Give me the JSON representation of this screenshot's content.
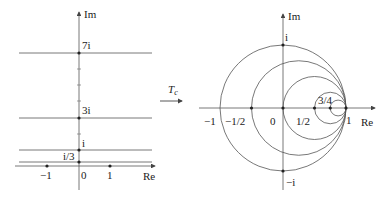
{
  "left_plane": {
    "axis_x_label": "Re",
    "axis_y_label": "Im",
    "origin_label": "0",
    "x_ticks": [
      {
        "label": "−1",
        "value": -1
      },
      {
        "label": "1",
        "value": 1
      }
    ],
    "horizontal_lines": [
      {
        "label": "7i",
        "im": 7
      },
      {
        "label": "3i",
        "im": 3
      },
      {
        "label": "i",
        "im": 1
      },
      {
        "label": "i/3",
        "im": 0.3333
      }
    ]
  },
  "transform": {
    "label": "T",
    "subscript": "c"
  },
  "right_plane": {
    "axis_x_label": "Re",
    "axis_y_label": "Im",
    "origin_label": "0",
    "top_label": "i",
    "bottom_label": "−i",
    "x_tick_labels": [
      "−1",
      "−1/2",
      "0",
      "1/2",
      "1"
    ],
    "inner_label": "3/4",
    "circles": [
      {
        "center": 0,
        "radius": 1
      },
      {
        "center": 0.25,
        "radius": 0.75
      },
      {
        "center": 0.5,
        "radius": 0.5
      },
      {
        "center": 0.75,
        "radius": 0.25
      },
      {
        "center": 0.875,
        "radius": 0.125
      }
    ]
  },
  "colors": {
    "stroke": "#555555",
    "text": "#222222",
    "background": "#ffffff"
  }
}
